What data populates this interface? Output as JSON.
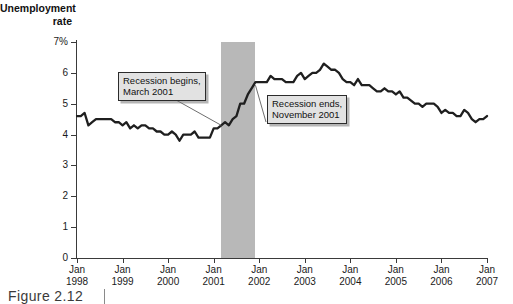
{
  "figure": {
    "caption": "Figure  2.12"
  },
  "chart_data": {
    "type": "line",
    "title": "",
    "ylabel": "Unemployment\nrate",
    "xlabel": "",
    "ylim": [
      0,
      7
    ],
    "xlim": [
      1998.0,
      2007.0
    ],
    "grid": false,
    "legend": "none",
    "y_ticks": [
      {
        "value": 7,
        "label": "7%"
      },
      {
        "value": 6,
        "label": "6"
      },
      {
        "value": 5,
        "label": "5"
      },
      {
        "value": 4,
        "label": "4"
      },
      {
        "value": 3,
        "label": "3"
      },
      {
        "value": 2,
        "label": "2"
      },
      {
        "value": 1,
        "label": "1"
      },
      {
        "value": 0,
        "label": "0"
      }
    ],
    "x_ticks": [
      {
        "value": 1998.0,
        "label": "Jan\n1998"
      },
      {
        "value": 1999.0,
        "label": "Jan\n1999"
      },
      {
        "value": 2000.0,
        "label": "Jan\n2000"
      },
      {
        "value": 2001.0,
        "label": "Jan\n2001"
      },
      {
        "value": 2002.0,
        "label": "Jan\n2002"
      },
      {
        "value": 2003.0,
        "label": "Jan\n2003"
      },
      {
        "value": 2004.0,
        "label": "Jan\n2004"
      },
      {
        "value": 2005.0,
        "label": "Jan\n2005"
      },
      {
        "value": 2006.0,
        "label": "Jan\n2006"
      },
      {
        "value": 2007.0,
        "label": "Jan\n2007"
      }
    ],
    "series": [
      {
        "name": "Unemployment rate",
        "color": "#1f1f1f",
        "x": [
          1998.0,
          1998.083,
          1998.167,
          1998.25,
          1998.333,
          1998.417,
          1998.5,
          1998.583,
          1998.667,
          1998.75,
          1998.833,
          1998.917,
          1999.0,
          1999.083,
          1999.167,
          1999.25,
          1999.333,
          1999.417,
          1999.5,
          1999.583,
          1999.667,
          1999.75,
          1999.833,
          1999.917,
          2000.0,
          2000.083,
          2000.167,
          2000.25,
          2000.333,
          2000.417,
          2000.5,
          2000.583,
          2000.667,
          2000.75,
          2000.833,
          2000.917,
          2001.0,
          2001.083,
          2001.167,
          2001.25,
          2001.333,
          2001.417,
          2001.5,
          2001.583,
          2001.667,
          2001.75,
          2001.833,
          2001.917,
          2002.0,
          2002.083,
          2002.167,
          2002.25,
          2002.333,
          2002.417,
          2002.5,
          2002.583,
          2002.667,
          2002.75,
          2002.833,
          2002.917,
          2003.0,
          2003.083,
          2003.167,
          2003.25,
          2003.333,
          2003.417,
          2003.5,
          2003.583,
          2003.667,
          2003.75,
          2003.833,
          2003.917,
          2004.0,
          2004.083,
          2004.167,
          2004.25,
          2004.333,
          2004.417,
          2004.5,
          2004.583,
          2004.667,
          2004.75,
          2004.833,
          2004.917,
          2005.0,
          2005.083,
          2005.167,
          2005.25,
          2005.333,
          2005.417,
          2005.5,
          2005.583,
          2005.667,
          2005.75,
          2005.833,
          2005.917,
          2006.0,
          2006.083,
          2006.167,
          2006.25,
          2006.333,
          2006.417,
          2006.5,
          2006.583,
          2006.667,
          2006.75,
          2006.833,
          2006.917,
          2007.0
        ],
        "y": [
          4.6,
          4.6,
          4.7,
          4.3,
          4.4,
          4.5,
          4.5,
          4.5,
          4.5,
          4.5,
          4.4,
          4.4,
          4.3,
          4.4,
          4.2,
          4.3,
          4.2,
          4.3,
          4.3,
          4.2,
          4.2,
          4.1,
          4.1,
          4.0,
          4.0,
          4.1,
          4.0,
          3.8,
          4.0,
          4.0,
          4.0,
          4.1,
          3.9,
          3.9,
          3.9,
          3.9,
          4.2,
          4.2,
          4.3,
          4.4,
          4.3,
          4.5,
          4.6,
          5.0,
          5.0,
          5.3,
          5.5,
          5.7,
          5.7,
          5.7,
          5.7,
          5.9,
          5.8,
          5.8,
          5.8,
          5.7,
          5.7,
          5.7,
          5.9,
          6.0,
          5.8,
          5.9,
          6.0,
          6.0,
          6.1,
          6.3,
          6.2,
          6.1,
          6.1,
          6.0,
          5.8,
          5.7,
          5.7,
          5.6,
          5.8,
          5.6,
          5.6,
          5.6,
          5.5,
          5.4,
          5.4,
          5.5,
          5.4,
          5.4,
          5.3,
          5.4,
          5.2,
          5.2,
          5.1,
          5.0,
          5.0,
          4.9,
          5.0,
          5.0,
          5.0,
          4.9,
          4.7,
          4.8,
          4.7,
          4.7,
          4.6,
          4.6,
          4.8,
          4.7,
          4.5,
          4.4,
          4.5,
          4.5,
          4.6
        ]
      }
    ],
    "shaded_regions": [
      {
        "name": "recession",
        "label": "2001 recession",
        "start": 2001.167,
        "end": 2001.917,
        "color": "#b8b8b8"
      }
    ],
    "annotations": [
      {
        "name": "recession-begins",
        "text": "Recession begins,\nMarch 2001",
        "target_x": 2001.167,
        "target_y": 4.3
      },
      {
        "name": "recession-ends",
        "text": "Recession ends,\nNovember 2001",
        "target_x": 2001.917,
        "target_y": 5.6
      }
    ]
  }
}
